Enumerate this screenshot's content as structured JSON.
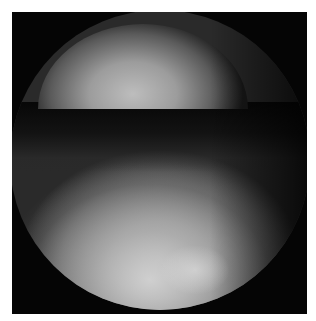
{
  "image": {
    "description": "Grayscale arthroscopic/endoscopic view with circular field of view",
    "colors": {
      "border": "#ffffff",
      "background": "#050505",
      "tissue_bright": "#c9c9c9",
      "tissue_mid": "#8a8a8a"
    }
  }
}
